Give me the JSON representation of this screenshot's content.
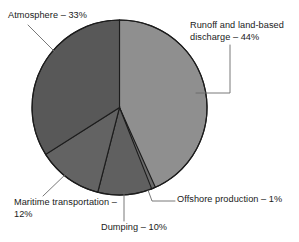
{
  "chart_data": {
    "type": "pie",
    "title": "",
    "subtitle": "",
    "xlabel": "",
    "ylabel": "",
    "legend_position": "none",
    "grid": false,
    "labels_outside": true,
    "unit": "%",
    "categories": [
      "Runoff and land-based discharge",
      "Dumping",
      "Offshore production",
      "Maritime transportation",
      "Atmosphere"
    ],
    "values": [
      44,
      10,
      1,
      12,
      33
    ],
    "slices": [
      {
        "name": "Runoff and land-based discharge",
        "label_text": "Runoff and land-based discharge – 44%",
        "value": 44,
        "color": "#8f8f8f",
        "start_angle_deg": 0,
        "end_angle_deg": 158.4
      },
      {
        "name": "Dumping",
        "label_text": "Dumping – 10%",
        "value": 10,
        "color": "#606060",
        "start_angle_deg": 158.4,
        "end_angle_deg": 194.4
      },
      {
        "name": "Offshore production",
        "label_text": "Offshore production – 1%",
        "value": 1,
        "color": "#6a6a6a",
        "start_angle_deg": 155.8,
        "end_angle_deg": 159.4
      },
      {
        "name": "Maritime transportation",
        "label_text": "Maritime transportation – 12%",
        "value": 12,
        "color": "#636363",
        "start_angle_deg": 194.4,
        "end_angle_deg": 237.6
      },
      {
        "name": "Atmosphere",
        "label_text": "Atmosphere – 33%",
        "value": 33,
        "color": "#585858",
        "start_angle_deg": 237.6,
        "end_angle_deg": 360
      }
    ],
    "colors": {
      "runoff": "#8f8f8f",
      "dumping": "#606060",
      "offshore": "#6a6a6a",
      "maritime": "#636363",
      "atmosphere": "#585858",
      "outline": "#1c1c1c",
      "leader_line": "#5a5a5a",
      "background": "#ffffff",
      "text": "#1a1a1a"
    }
  },
  "labels": {
    "atmosphere": "Atmosphere – 33%",
    "runoff": "Runoff and land-based discharge – 44%",
    "maritime": "Maritime transportation – 12%",
    "dumping": "Dumping – 10%",
    "offshore": "Offshore production – 1%"
  }
}
